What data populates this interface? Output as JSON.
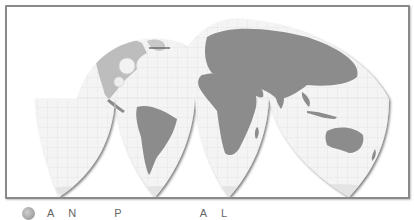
{
  "map": {
    "projection": "interrupted (butterfly / Goode-style) world map",
    "style": "grayscale shaded relief with graticule",
    "lobes": [
      {
        "name": "north-america-lobe",
        "hemisphere": "north"
      },
      {
        "name": "eurasia-lobe",
        "hemisphere": "north"
      },
      {
        "name": "pacific-south-lobe",
        "hemisphere": "south"
      },
      {
        "name": "south-america-lobe",
        "hemisphere": "south"
      },
      {
        "name": "africa-lobe",
        "hemisphere": "south"
      },
      {
        "name": "australia-lobe",
        "hemisphere": "south"
      }
    ],
    "colors": {
      "land": "#8c8c8c",
      "ocean": "#f4f4f4",
      "graticule": "#d6d6d6",
      "frame": "#8a8a8a",
      "lobe_shadow": "#555555"
    }
  },
  "caption": {
    "icon": "globe-icon",
    "words": [
      "A",
      "N",
      "P",
      "A",
      "L"
    ]
  }
}
